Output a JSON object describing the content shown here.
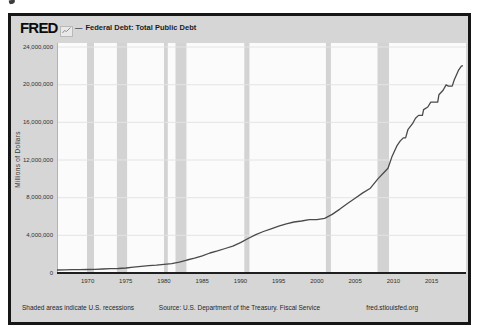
{
  "header": {
    "logo_text": "FRED",
    "logo_icon": "line-chart-icon",
    "legend_dash": "—",
    "series_label": "Federal Debt: Total Public Debt"
  },
  "y_axis": {
    "title": "Millions of Dollars",
    "tick_labels": [
      "24,000,000",
      "20,000,000",
      "16,000,000",
      "12,000,000",
      "8,000,000",
      "4,000,000",
      "0"
    ],
    "tick_values": [
      24000000,
      20000000,
      16000000,
      12000000,
      8000000,
      4000000,
      0
    ]
  },
  "x_axis": {
    "tick_labels": [
      "1970",
      "1975",
      "1980",
      "1985",
      "1990",
      "1995",
      "2000",
      "2005",
      "2010",
      "2015"
    ],
    "tick_values": [
      1970,
      1975,
      1980,
      1985,
      1990,
      1995,
      2000,
      2005,
      2010,
      2015
    ]
  },
  "footer": {
    "left": "Shaded areas indicate U.S. recessions",
    "center": "Source: U.S. Department of the Treasury. Fiscal Service",
    "right": "fred.stlouisfed.org"
  },
  "colors": {
    "frame_border": "#161616",
    "chart_background": "#d6d6d6",
    "plot_background": "#fbfbfb",
    "recession_band": "#d3d3d3",
    "gridline": "#e4e4e4",
    "axis_line": "#1f1f1f",
    "plot_edge": "#b3b3b3",
    "series_line": "#4a4a4a",
    "text": "#262626"
  },
  "chart_data": {
    "type": "line",
    "title": "Federal Debt: Total Public Debt",
    "xlabel": "",
    "ylabel": "Millions of Dollars",
    "unit": "millions of U.S. dollars",
    "xlim": [
      1966,
      2019.5
    ],
    "ylim": [
      0,
      24000000
    ],
    "grid": "horizontal",
    "legend_position": "top-left",
    "recession_bands": [
      [
        1969.92,
        1970.83
      ],
      [
        1973.83,
        1975.17
      ],
      [
        1980.0,
        1980.5
      ],
      [
        1981.5,
        1982.92
      ],
      [
        1990.5,
        1991.17
      ],
      [
        2001.17,
        2001.83
      ],
      [
        2007.92,
        2009.42
      ]
    ],
    "series": [
      {
        "name": "Federal Debt: Total Public Debt",
        "points": [
          [
            1966,
            320000
          ],
          [
            1967,
            326000
          ],
          [
            1968,
            348000
          ],
          [
            1969,
            354000
          ],
          [
            1970,
            371000
          ],
          [
            1971,
            398000
          ],
          [
            1972,
            427000
          ],
          [
            1973,
            458000
          ],
          [
            1974,
            475000
          ],
          [
            1975,
            533000
          ],
          [
            1976,
            620000
          ],
          [
            1977,
            699000
          ],
          [
            1978,
            772000
          ],
          [
            1979,
            827000
          ],
          [
            1980,
            908000
          ],
          [
            1981,
            998000
          ],
          [
            1982,
            1142000
          ],
          [
            1983,
            1377000
          ],
          [
            1984,
            1572000
          ],
          [
            1985,
            1823000
          ],
          [
            1986,
            2125000
          ],
          [
            1987,
            2350000
          ],
          [
            1988,
            2602000
          ],
          [
            1989,
            2857000
          ],
          [
            1990,
            3233000
          ],
          [
            1991,
            3665000
          ],
          [
            1992,
            4065000
          ],
          [
            1993,
            4411000
          ],
          [
            1994,
            4693000
          ],
          [
            1995,
            4974000
          ],
          [
            1996,
            5225000
          ],
          [
            1997,
            5413000
          ],
          [
            1998,
            5526000
          ],
          [
            1999,
            5656000
          ],
          [
            2000,
            5674000
          ],
          [
            2001,
            5807000
          ],
          [
            2002,
            6228000
          ],
          [
            2003,
            6783000
          ],
          [
            2004,
            7379000
          ],
          [
            2005,
            7933000
          ],
          [
            2006,
            8507000
          ],
          [
            2007,
            9008000
          ],
          [
            2008,
            10025000
          ],
          [
            2008.8,
            10700000
          ],
          [
            2009.3,
            11127000
          ],
          [
            2009.8,
            12311000
          ],
          [
            2010.5,
            13562000
          ],
          [
            2010.9,
            14025000
          ],
          [
            2011.3,
            14344000
          ],
          [
            2011.6,
            14343000
          ],
          [
            2011.9,
            15223000
          ],
          [
            2012.5,
            15856000
          ],
          [
            2012.9,
            16433000
          ],
          [
            2013.3,
            16738000
          ],
          [
            2013.8,
            16738000
          ],
          [
            2013.95,
            17352000
          ],
          [
            2014.5,
            17632000
          ],
          [
            2014.9,
            18141000
          ],
          [
            2015.2,
            18152000
          ],
          [
            2015.8,
            18151000
          ],
          [
            2015.95,
            18922000
          ],
          [
            2016.5,
            19400000
          ],
          [
            2016.9,
            19977000
          ],
          [
            2017.2,
            19846000
          ],
          [
            2017.7,
            19845000
          ],
          [
            2017.95,
            20493000
          ],
          [
            2018.5,
            21516000
          ],
          [
            2018.9,
            21974000
          ],
          [
            2019.1,
            22028000
          ]
        ]
      }
    ]
  }
}
